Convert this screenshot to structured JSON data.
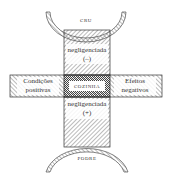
{
  "diagram": {
    "top_pole": {
      "label": "CRU"
    },
    "bottom_pole": {
      "label": "PODRE"
    },
    "center": {
      "label": "COZINHA"
    },
    "upper_column": {
      "label": "negligenciada",
      "sign": "(–)"
    },
    "lower_column": {
      "label": "negligenciada",
      "sign": "(+)"
    },
    "left_arm": {
      "line1": "Condições",
      "line2": "positivas"
    },
    "right_arm": {
      "line1": "Efeitos",
      "line2": "negativos"
    },
    "colors": {
      "stroke": "#333333",
      "hatch": "#555555",
      "background": "#ffffff"
    }
  }
}
